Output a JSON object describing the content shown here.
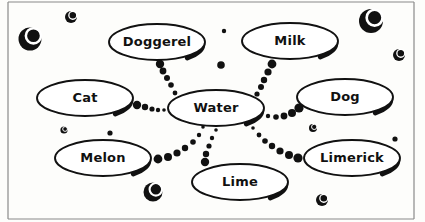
{
  "diagram": {
    "background_color": "#fdfdfb",
    "ink_color": "#111111",
    "border": {
      "name": "page-frame",
      "color": "#8a8a8a",
      "left_x": 8,
      "right_x": 414,
      "top_y": 2,
      "bottom_y": 219
    },
    "center_node": "Water",
    "nodes": [
      {
        "id": "doggerel",
        "label": "Doggerel",
        "cx": 157,
        "cy": 42,
        "rx": 48,
        "ry": 18,
        "font": 13
      },
      {
        "id": "milk",
        "label": "Milk",
        "cx": 290,
        "cy": 41,
        "rx": 48,
        "ry": 18,
        "font": 14
      },
      {
        "id": "cat",
        "label": "Cat",
        "cx": 85,
        "cy": 98,
        "rx": 48,
        "ry": 18,
        "font": 14
      },
      {
        "id": "water",
        "label": "Water",
        "cx": 216,
        "cy": 108,
        "rx": 48,
        "ry": 18,
        "font": 14
      },
      {
        "id": "dog",
        "label": "Dog",
        "cx": 345,
        "cy": 97,
        "rx": 48,
        "ry": 18,
        "font": 14
      },
      {
        "id": "melon",
        "label": "Melon",
        "cx": 103,
        "cy": 158,
        "rx": 48,
        "ry": 18,
        "font": 14
      },
      {
        "id": "limerick",
        "label": "Limerick",
        "cx": 352,
        "cy": 158,
        "rx": 48,
        "ry": 18,
        "font": 13
      },
      {
        "id": "lime",
        "label": "Lime",
        "cx": 240,
        "cy": 182,
        "rx": 48,
        "ry": 18,
        "font": 14
      }
    ],
    "edges": [
      {
        "id": "water-doggerel",
        "from": "water",
        "to": "doggerel",
        "dots": [
          {
            "x": 180,
            "y": 100,
            "r": 2.0
          },
          {
            "x": 175,
            "y": 93,
            "r": 2.4
          },
          {
            "x": 171,
            "y": 85,
            "r": 2.8
          },
          {
            "x": 167,
            "y": 78,
            "r": 3.0
          },
          {
            "x": 163,
            "y": 71,
            "r": 3.4
          },
          {
            "x": 160,
            "y": 64,
            "r": 4.2
          }
        ]
      },
      {
        "id": "water-milk",
        "from": "water",
        "to": "milk",
        "dots": [
          {
            "x": 252,
            "y": 101,
            "r": 2.2
          },
          {
            "x": 257,
            "y": 94,
            "r": 2.6
          },
          {
            "x": 261,
            "y": 87,
            "r": 3.0
          },
          {
            "x": 264,
            "y": 80,
            "r": 3.2
          },
          {
            "x": 268,
            "y": 72,
            "r": 3.6
          },
          {
            "x": 272,
            "y": 64,
            "r": 4.4
          }
        ]
      },
      {
        "id": "water-cat",
        "from": "water",
        "to": "cat",
        "dots": [
          {
            "x": 164,
            "y": 110,
            "r": 1.8
          },
          {
            "x": 158,
            "y": 110,
            "r": 2.2
          },
          {
            "x": 152,
            "y": 109,
            "r": 2.6
          },
          {
            "x": 145,
            "y": 107,
            "r": 3.2
          },
          {
            "x": 137,
            "y": 105,
            "r": 4.2
          }
        ]
      },
      {
        "id": "water-dog",
        "from": "water",
        "to": "dog",
        "dots": [
          {
            "x": 268,
            "y": 116,
            "r": 2.2
          },
          {
            "x": 276,
            "y": 117,
            "r": 2.8
          },
          {
            "x": 284,
            "y": 116,
            "r": 3.4
          },
          {
            "x": 292,
            "y": 113,
            "r": 4.0
          },
          {
            "x": 299,
            "y": 108,
            "r": 4.6
          }
        ]
      },
      {
        "id": "water-melon",
        "from": "water",
        "to": "melon",
        "dots": [
          {
            "x": 203,
            "y": 127,
            "r": 1.8
          },
          {
            "x": 199,
            "y": 135,
            "r": 2.2
          },
          {
            "x": 193,
            "y": 142,
            "r": 2.8
          },
          {
            "x": 185,
            "y": 148,
            "r": 3.2
          },
          {
            "x": 177,
            "y": 153,
            "r": 3.6
          },
          {
            "x": 168,
            "y": 157,
            "r": 4.0
          },
          {
            "x": 158,
            "y": 159,
            "r": 4.4
          }
        ]
      },
      {
        "id": "water-limerick",
        "from": "water",
        "to": "limerick",
        "dots": [
          {
            "x": 253,
            "y": 128,
            "r": 1.8
          },
          {
            "x": 259,
            "y": 135,
            "r": 2.4
          },
          {
            "x": 265,
            "y": 141,
            "r": 2.8
          },
          {
            "x": 272,
            "y": 146,
            "r": 3.2
          },
          {
            "x": 280,
            "y": 151,
            "r": 3.6
          },
          {
            "x": 289,
            "y": 155,
            "r": 4.0
          },
          {
            "x": 298,
            "y": 158,
            "r": 4.6
          }
        ]
      },
      {
        "id": "water-lime",
        "from": "water",
        "to": "lime",
        "dots": [
          {
            "x": 216,
            "y": 130,
            "r": 1.8
          },
          {
            "x": 212,
            "y": 138,
            "r": 2.2
          },
          {
            "x": 209,
            "y": 146,
            "r": 2.6
          },
          {
            "x": 206,
            "y": 154,
            "r": 3.2
          },
          {
            "x": 205,
            "y": 162,
            "r": 4.2
          }
        ]
      }
    ],
    "decorative_bubbles": [
      {
        "id": "bubble-1",
        "cx": 30,
        "cy": 39,
        "r": 11.5,
        "highlight": true
      },
      {
        "id": "bubble-2",
        "cx": 71,
        "cy": 17,
        "r": 6.0,
        "highlight": true
      },
      {
        "id": "bubble-3",
        "cx": 371,
        "cy": 21,
        "r": 12.0,
        "highlight": true
      },
      {
        "id": "bubble-4",
        "cx": 399,
        "cy": 55,
        "r": 6.0,
        "highlight": true
      },
      {
        "id": "bubble-5",
        "cx": 224,
        "cy": 31,
        "r": 2.2,
        "highlight": false
      },
      {
        "id": "bubble-6",
        "cx": 221,
        "cy": 65,
        "r": 3.8,
        "highlight": false
      },
      {
        "id": "bubble-7",
        "cx": 64,
        "cy": 130,
        "r": 3.6,
        "highlight": true
      },
      {
        "id": "bubble-8",
        "cx": 110,
        "cy": 133,
        "r": 2.6,
        "highlight": false
      },
      {
        "id": "bubble-9",
        "cx": 313,
        "cy": 128,
        "r": 4.0,
        "highlight": true
      },
      {
        "id": "bubble-10",
        "cx": 395,
        "cy": 139,
        "r": 2.6,
        "highlight": false
      },
      {
        "id": "bubble-11",
        "cx": 101,
        "cy": 150,
        "r": 2.0,
        "highlight": false
      },
      {
        "id": "bubble-12",
        "cx": 153,
        "cy": 192,
        "r": 9.5,
        "highlight": true
      },
      {
        "id": "bubble-13",
        "cx": 322,
        "cy": 200,
        "r": 6.0,
        "highlight": true
      }
    ]
  }
}
